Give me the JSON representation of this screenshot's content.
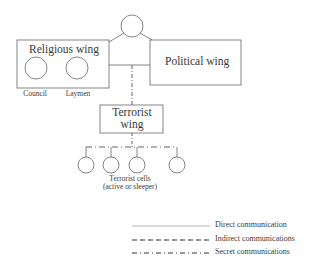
{
  "diagram": {
    "type": "organizational-structure",
    "nodes": {
      "leadership": {
        "label": ""
      },
      "religious_wing": {
        "label": "Religious wing",
        "members": [
          {
            "label": "Council"
          },
          {
            "label": "Laymen"
          }
        ]
      },
      "political_wing": {
        "label": "Political wing"
      },
      "terrorist_wing": {
        "label_line1": "Terrorist",
        "label_line2": "wing"
      },
      "terrorist_cells": {
        "label_line1": "Terrorist cells",
        "label_line2": "(active or sleeper)",
        "count": 4
      }
    },
    "edges": [
      {
        "from": "leadership",
        "to": "religious_wing",
        "style": "direct"
      },
      {
        "from": "leadership",
        "to": "political_wing",
        "style": "direct"
      },
      {
        "from": "religious_wing",
        "to": "political_wing",
        "style": "direct"
      },
      {
        "from": "religious_political_link",
        "to": "terrorist_wing",
        "style": "secret"
      },
      {
        "from": "terrorist_wing",
        "to": "terrorist_cells",
        "style": "secret"
      }
    ],
    "legend": [
      {
        "style": "direct",
        "label": "Direct communication"
      },
      {
        "style": "indirect",
        "label": "Indirect communications"
      },
      {
        "style": "secret",
        "label": "Secret communications"
      }
    ],
    "colors": {
      "stroke": "#555555",
      "text": "#3a3a3a",
      "background": "#ffffff"
    }
  }
}
